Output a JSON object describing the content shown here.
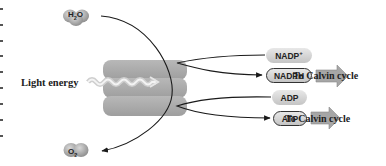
{
  "diagram": {
    "type": "light-reactions-photosynthesis",
    "inputs": {
      "water": {
        "label": "H",
        "sub": "2",
        "suffix": "O"
      },
      "light": {
        "label": "Light energy"
      }
    },
    "outputs": {
      "oxygen": {
        "label": "O",
        "sub": "2"
      }
    },
    "carriers": [
      {
        "id": "nadp",
        "label": "NADP",
        "sup": "+",
        "outlined": false
      },
      {
        "id": "nadph",
        "label": "NADPH",
        "outlined": true
      },
      {
        "id": "adp",
        "label": "ADP",
        "outlined": false
      },
      {
        "id": "atp",
        "label": "ATP",
        "outlined": true
      }
    ],
    "destinations": [
      {
        "from": "nadph",
        "label": "To Calvin cycle"
      },
      {
        "from": "atp",
        "label": "To Calvin cycle"
      }
    ],
    "colors": {
      "membrane": "#a9a9a9",
      "membrane_light": "#bdbdbd",
      "pill_top": "#e8e8e8",
      "pill_bottom": "#c4c4c4",
      "arrow_fill": "#a6a6a6",
      "molecule": "#9a9a9a",
      "line": "#1a1a1a"
    }
  }
}
